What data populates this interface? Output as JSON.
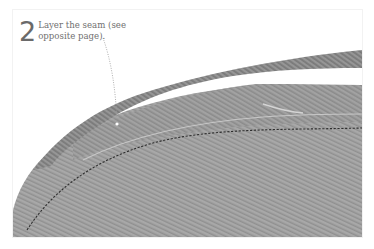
{
  "figure": {
    "step_number": "2",
    "caption": "Layer the seam (see opposite page).",
    "colors": {
      "fabric_main": "#9a9a9a",
      "fabric_top_layer": "#8c8c8c",
      "stitch": "#2e2e2e",
      "leader_line": "#9a9a9a",
      "text": "#6e6e6e",
      "background": "#ffffff"
    }
  }
}
